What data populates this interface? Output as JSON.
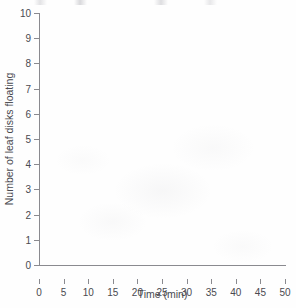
{
  "chart_data": {
    "type": "line",
    "title": "",
    "subtitle": "",
    "xlabel": "Time (min)",
    "ylabel": "Number of leaf disks floating",
    "xlim": [
      0,
      50
    ],
    "ylim": [
      0,
      10
    ],
    "xticks": [
      0,
      5,
      10,
      15,
      20,
      25,
      30,
      35,
      40,
      45,
      50
    ],
    "yticks": [
      0,
      1,
      2,
      3,
      4,
      5,
      6,
      7,
      8,
      9,
      10
    ],
    "xtick_labels": [
      "0",
      "5",
      "10",
      "15",
      "20",
      "25",
      "30",
      "35",
      "40",
      "45",
      "50"
    ],
    "ytick_labels": [
      "0",
      "1",
      "2",
      "3",
      "4",
      "5",
      "6",
      "7",
      "8",
      "9",
      "10"
    ],
    "grid": false,
    "legend": false,
    "legend_position": "none",
    "annotations": [],
    "series": [],
    "x": [],
    "values": [],
    "note": "Blank graph template - axes only, no data plotted"
  },
  "figure": {
    "axis_color": "#8a8a8f",
    "text_color": "#4a4a50",
    "background_color": "#fefefe"
  }
}
